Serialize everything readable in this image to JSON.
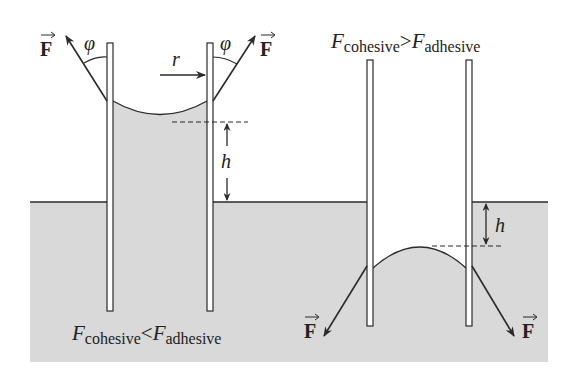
{
  "colors": {
    "liquid": "#d9d9d9",
    "line": "#2a2a2a",
    "tube_fill": "#ffffff"
  },
  "left_panel": {
    "force_symbol": "F",
    "angle_symbol": "φ",
    "radius_symbol": "r",
    "height_symbol": "h",
    "caption": {
      "lhs": "F",
      "lhs_sub": "cohesive",
      "relation": "<",
      "rhs": "F",
      "rhs_sub": "adhesive"
    },
    "meniscus": "concave"
  },
  "right_panel": {
    "force_symbol": "F",
    "height_symbol": "h",
    "caption": {
      "lhs": "F",
      "lhs_sub": "cohesive",
      "relation": ">",
      "rhs": "F",
      "rhs_sub": "adhesive"
    },
    "meniscus": "convex"
  }
}
